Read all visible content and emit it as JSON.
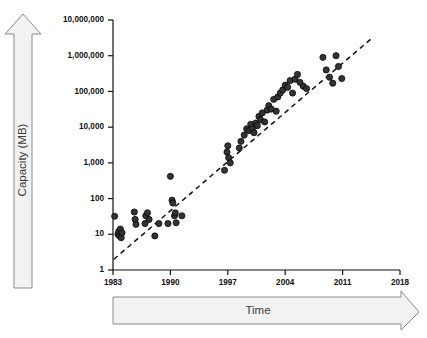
{
  "figure": {
    "background_color": "#ffffff",
    "axis_color": "#111111",
    "marker_color": "#333333",
    "marker_edge_color": "#000000",
    "trendline_color": "#111111",
    "arrow_fill_color": "#f2f2f2",
    "arrow_border_color": "#8c8c8c",
    "arrow_text_color": "#3b3b3b"
  },
  "labels": {
    "y_arrow": "Capacity (MB)",
    "x_arrow": "Time"
  },
  "chart_data": {
    "type": "scatter",
    "title": "",
    "subtitle": "",
    "xlabel": "Time",
    "ylabel": "Capacity (MB)",
    "yscale": "log",
    "xscale": "linear",
    "xlim": [
      1983,
      2018
    ],
    "ylim": [
      1,
      10000000
    ],
    "grid": false,
    "legend": null,
    "xticks": [
      1983,
      1990,
      1997,
      2004,
      2011,
      2018
    ],
    "xticklabels": [
      "1983",
      "1990",
      "1997",
      "2004",
      "2011",
      "2018"
    ],
    "yticks": [
      1,
      10,
      100,
      1000,
      10000,
      100000,
      1000000,
      10000000
    ],
    "yticklabels": [
      "1",
      "10",
      "100",
      "1,000",
      "10,000",
      "100,000",
      "1,000,000",
      "10,000,000"
    ],
    "annotations": [
      {
        "type": "trendline",
        "style": "dashed",
        "x": [
          1983.1,
          2014.5
        ],
        "y": [
          2.0,
          3000000
        ]
      }
    ],
    "series": [
      {
        "name": "Hard drive capacity",
        "marker": "circle",
        "points": [
          [
            1983.2,
            32
          ],
          [
            1983.6,
            10
          ],
          [
            1983.7,
            12
          ],
          [
            1983.8,
            9
          ],
          [
            1983.9,
            14
          ],
          [
            1984.0,
            8
          ],
          [
            1984.1,
            11
          ],
          [
            1985.6,
            42
          ],
          [
            1985.7,
            26
          ],
          [
            1985.8,
            19
          ],
          [
            1986.9,
            20
          ],
          [
            1987.0,
            33
          ],
          [
            1987.2,
            40
          ],
          [
            1987.4,
            26
          ],
          [
            1988.1,
            9
          ],
          [
            1988.6,
            20
          ],
          [
            1989.7,
            20
          ],
          [
            1990.0,
            420
          ],
          [
            1990.2,
            90
          ],
          [
            1990.3,
            75
          ],
          [
            1990.5,
            33
          ],
          [
            1990.6,
            40
          ],
          [
            1990.7,
            21
          ],
          [
            1991.4,
            33
          ],
          [
            1996.6,
            620
          ],
          [
            1996.9,
            2000
          ],
          [
            1997.0,
            3000
          ],
          [
            1997.1,
            1400
          ],
          [
            1997.3,
            1000
          ],
          [
            1998.4,
            2600
          ],
          [
            1998.6,
            4000
          ],
          [
            1999.0,
            6000
          ],
          [
            1999.3,
            9000
          ],
          [
            1999.6,
            8000
          ],
          [
            1999.8,
            12000
          ],
          [
            2000.0,
            9000
          ],
          [
            2000.2,
            7000
          ],
          [
            2000.4,
            13000
          ],
          [
            2000.6,
            11000
          ],
          [
            2000.8,
            20000
          ],
          [
            2001.0,
            16000
          ],
          [
            2001.2,
            25000
          ],
          [
            2001.5,
            14000
          ],
          [
            2001.8,
            30000
          ],
          [
            2002.0,
            40000
          ],
          [
            2002.3,
            32000
          ],
          [
            2002.6,
            60000
          ],
          [
            2002.9,
            28000
          ],
          [
            2003.1,
            70000
          ],
          [
            2003.4,
            90000
          ],
          [
            2003.7,
            110000
          ],
          [
            2004.0,
            150000
          ],
          [
            2004.3,
            130000
          ],
          [
            2004.6,
            200000
          ],
          [
            2004.9,
            90000
          ],
          [
            2005.2,
            220000
          ],
          [
            2005.5,
            300000
          ],
          [
            2005.8,
            180000
          ],
          [
            2006.2,
            140000
          ],
          [
            2006.6,
            120000
          ],
          [
            2008.6,
            900000
          ],
          [
            2009.0,
            400000
          ],
          [
            2009.4,
            250000
          ],
          [
            2009.8,
            170000
          ],
          [
            2010.2,
            1000000
          ],
          [
            2010.5,
            500000
          ],
          [
            2010.9,
            230000
          ]
        ]
      }
    ]
  }
}
